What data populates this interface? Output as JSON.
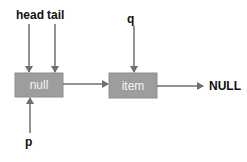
{
  "diagram": {
    "type": "linked-list",
    "colors": {
      "node_fill": "#9d9d9d",
      "node_text": "#f4f4f4",
      "arrow": "#6e6e6e",
      "label": "#111111",
      "background": "#ffffff"
    },
    "nodes": [
      {
        "id": "node-null",
        "text": "null"
      },
      {
        "id": "node-item",
        "text": "item"
      }
    ],
    "terminal": {
      "text": "NULL"
    },
    "pointers": [
      {
        "name": "head",
        "target": "node-null",
        "direction": "down"
      },
      {
        "name": "tail",
        "target": "node-null",
        "direction": "down"
      },
      {
        "name": "q",
        "target": "node-item",
        "direction": "down"
      },
      {
        "name": "p",
        "target": "node-null",
        "direction": "up"
      }
    ],
    "edges": [
      {
        "from": "node-null",
        "to": "node-item"
      },
      {
        "from": "node-item",
        "to": "NULL"
      }
    ]
  }
}
